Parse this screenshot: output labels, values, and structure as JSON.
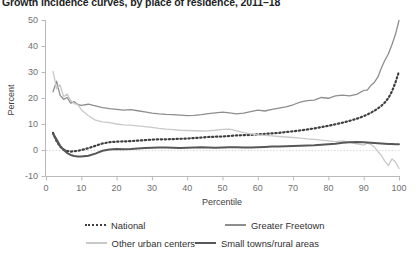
{
  "title": "Growth incidence curves, by place of residence, 2011–18",
  "axes": {
    "x_label": "Percentile",
    "y_label": "Percent",
    "x_ticks": [
      0,
      10,
      20,
      30,
      40,
      50,
      60,
      70,
      80,
      90,
      100
    ],
    "y_ticks": [
      50,
      40,
      30,
      20,
      10,
      0,
      -10
    ]
  },
  "legend": [
    {
      "label": "National",
      "color": "#3f3f3f",
      "style": "dotted",
      "width": 2.2
    },
    {
      "label": "Greater Freetown",
      "color": "#8e8e8e",
      "style": "solid",
      "width": 1.3
    },
    {
      "label": "Other urban centers",
      "color": "#c9c9c9",
      "style": "solid",
      "width": 1.3
    },
    {
      "label": "Small towns/rural areas",
      "color": "#575757",
      "style": "solid",
      "width": 2.0
    }
  ],
  "chart_data": {
    "type": "line",
    "title": "Growth incidence curves, by place of residence, 2011–18",
    "xlabel": "Percentile",
    "ylabel": "Percent",
    "xlim": [
      0,
      100
    ],
    "ylim": [
      -10,
      50
    ],
    "grid": false,
    "zero_reference_line": true,
    "legend_position": "bottom",
    "x": [
      2,
      3,
      4,
      5,
      6,
      7,
      8,
      9,
      10,
      12,
      14,
      16,
      18,
      20,
      22,
      24,
      26,
      28,
      30,
      32,
      34,
      36,
      38,
      40,
      42,
      44,
      46,
      48,
      50,
      52,
      54,
      56,
      58,
      60,
      62,
      64,
      66,
      68,
      70,
      72,
      74,
      76,
      78,
      80,
      82,
      84,
      86,
      88,
      90,
      91,
      92,
      93,
      94,
      95,
      96,
      97,
      98,
      99,
      100
    ],
    "series": [
      {
        "name": "National",
        "color": "#3f3f3f",
        "style": "dotted",
        "values": [
          6.6,
          3.4,
          1.3,
          0.2,
          -0.4,
          -0.6,
          -0.5,
          -0.3,
          0.0,
          0.7,
          1.6,
          2.5,
          3.0,
          3.2,
          3.3,
          3.4,
          3.6,
          3.8,
          4.0,
          4.1,
          4.1,
          4.2,
          4.3,
          4.4,
          4.6,
          4.8,
          5.0,
          5.1,
          5.2,
          5.4,
          5.6,
          5.7,
          5.8,
          6.0,
          6.2,
          6.4,
          6.6,
          6.9,
          7.2,
          7.5,
          7.9,
          8.3,
          8.8,
          9.3,
          9.9,
          10.5,
          11.2,
          12.0,
          13.0,
          13.6,
          14.3,
          15.1,
          16.0,
          17.0,
          18.3,
          20.0,
          22.5,
          26.0,
          30.2
        ]
      },
      {
        "name": "Greater Freetown",
        "color": "#8e8e8e",
        "style": "solid",
        "values": [
          22.4,
          26.5,
          21.0,
          19.5,
          20.2,
          18.0,
          18.6,
          17.5,
          17.2,
          17.6,
          17.0,
          16.3,
          15.9,
          15.6,
          15.3,
          15.5,
          15.1,
          14.7,
          14.2,
          13.9,
          13.7,
          13.6,
          13.4,
          13.2,
          13.3,
          13.6,
          14.0,
          14.3,
          14.6,
          14.3,
          13.9,
          14.2,
          14.8,
          15.3,
          15.0,
          15.6,
          16.1,
          16.6,
          17.4,
          18.4,
          19.0,
          19.2,
          20.2,
          19.9,
          20.8,
          21.1,
          20.8,
          21.4,
          22.9,
          23.0,
          24.8,
          26.0,
          28.0,
          31.5,
          34.5,
          37.0,
          40.5,
          44.5,
          49.8
        ]
      },
      {
        "name": "Other urban centers",
        "color": "#c9c9c9",
        "style": "solid",
        "values": [
          30.2,
          23.5,
          25.0,
          20.5,
          21.5,
          19.0,
          17.8,
          17.5,
          15.5,
          13.2,
          11.5,
          10.8,
          10.5,
          10.0,
          9.7,
          9.6,
          9.3,
          9.0,
          8.7,
          8.3,
          8.0,
          7.8,
          7.6,
          7.5,
          7.4,
          7.3,
          7.4,
          7.6,
          7.9,
          8.0,
          7.4,
          6.7,
          6.2,
          5.8,
          5.6,
          5.4,
          5.2,
          5.0,
          4.8,
          4.6,
          4.3,
          4.1,
          3.8,
          3.5,
          3.2,
          3.5,
          3.0,
          2.4,
          1.9,
          2.6,
          2.2,
          1.2,
          -0.6,
          -2.0,
          -4.4,
          -6.0,
          -3.4,
          -4.6,
          -7.1
        ]
      },
      {
        "name": "Small towns/rural areas",
        "color": "#575757",
        "style": "solid",
        "values": [
          6.2,
          4.0,
          1.6,
          0.0,
          -1.2,
          -1.9,
          -2.3,
          -2.5,
          -2.5,
          -2.2,
          -1.4,
          -0.3,
          0.2,
          0.4,
          0.3,
          0.4,
          0.6,
          0.8,
          0.9,
          1.0,
          1.0,
          0.9,
          0.8,
          0.9,
          1.0,
          1.1,
          1.0,
          0.9,
          1.0,
          1.1,
          1.1,
          1.0,
          1.0,
          1.1,
          1.2,
          1.3,
          1.3,
          1.4,
          1.5,
          1.6,
          1.7,
          1.8,
          2.0,
          2.2,
          2.4,
          2.8,
          3.0,
          3.1,
          3.0,
          2.9,
          2.8,
          2.7,
          2.6,
          2.5,
          2.4,
          2.3,
          2.3,
          2.2,
          2.2
        ]
      }
    ]
  }
}
